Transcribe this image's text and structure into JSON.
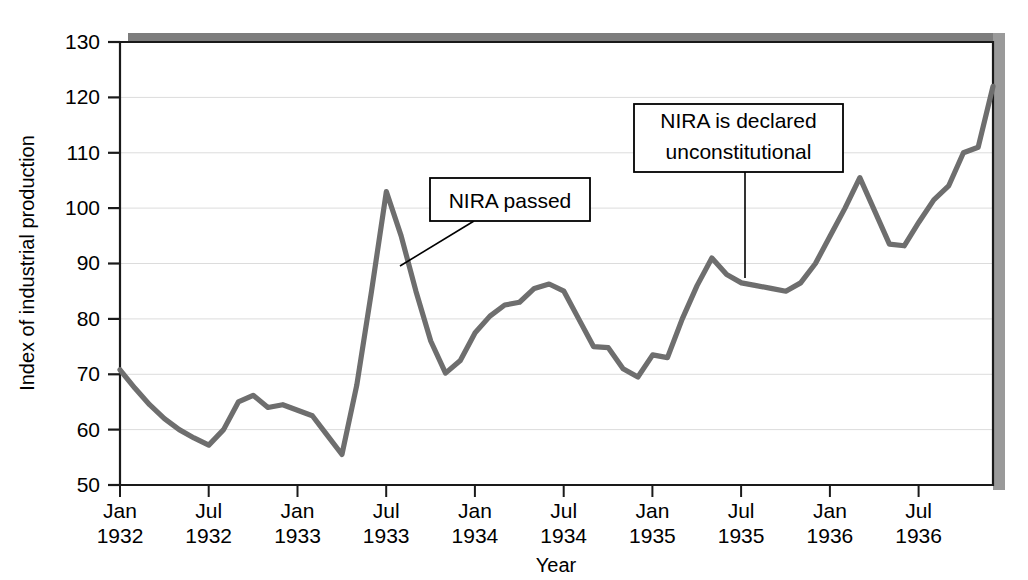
{
  "chart_data": {
    "type": "line",
    "title": "",
    "xlabel": "Year",
    "ylabel": "Index of industrial production",
    "ylim": [
      50,
      130
    ],
    "yticks": [
      50,
      60,
      70,
      80,
      90,
      100,
      110,
      120,
      130
    ],
    "grid": true,
    "legend_position": "none",
    "x_tick_labels": [
      {
        "line1": "Jan",
        "line2": "1932"
      },
      {
        "line1": "Jul",
        "line2": "1932"
      },
      {
        "line1": "Jan",
        "line2": "1933"
      },
      {
        "line1": "Jul",
        "line2": "1933"
      },
      {
        "line1": "Jan",
        "line2": "1934"
      },
      {
        "line1": "Jul",
        "line2": "1934"
      },
      {
        "line1": "Jan",
        "line2": "1935"
      },
      {
        "line1": "Jul",
        "line2": "1935"
      },
      {
        "line1": "Jan",
        "line2": "1936"
      },
      {
        "line1": "Jul",
        "line2": "1936"
      }
    ],
    "x_tick_positions_months": [
      0,
      6,
      12,
      18,
      24,
      30,
      36,
      42,
      48,
      54
    ],
    "x_range_months": [
      0,
      59
    ],
    "series": [
      {
        "name": "Index of industrial production",
        "color": "#6e6e6e",
        "x_months": [
          0,
          1,
          2,
          3,
          4,
          5,
          6,
          7,
          8,
          9,
          10,
          11,
          12,
          13,
          14,
          15,
          16,
          17,
          18,
          19,
          20,
          21,
          22,
          23,
          24,
          25,
          26,
          27,
          28,
          29,
          30,
          31,
          32,
          33,
          34,
          35,
          36,
          37,
          38,
          39,
          40,
          41,
          42,
          43,
          44,
          45,
          46,
          47,
          48,
          49,
          50,
          51,
          52,
          53,
          54,
          55,
          56,
          57,
          58,
          59
        ],
        "values": [
          70.8,
          67.5,
          64.5,
          62.0,
          60.0,
          58.5,
          57.2,
          60.0,
          65.0,
          66.2,
          64.0,
          64.5,
          63.5,
          62.5,
          59.0,
          55.5,
          68.0,
          85.0,
          103.0,
          95.0,
          85.0,
          76.0,
          70.2,
          72.5,
          77.5,
          80.5,
          82.5,
          83.0,
          85.5,
          86.3,
          85.0,
          80.0,
          75.0,
          74.8,
          71.0,
          69.5,
          73.5,
          73.0,
          80.0,
          86.0,
          91.0,
          88.0,
          86.5,
          86.0,
          85.5,
          85.0,
          86.5,
          90.0,
          95.0,
          100.0,
          105.5,
          99.5,
          93.5,
          93.2,
          97.5,
          101.5,
          104.0,
          110.0,
          111.0,
          122.0
        ]
      }
    ],
    "annotations": [
      {
        "id": "nira-passed",
        "text": "NIRA passed",
        "box": {
          "x": 430,
          "y": 178,
          "width": 160,
          "height": 43
        },
        "leader": {
          "x1": 474,
          "y1": 221,
          "x2": 400,
          "y2": 266
        }
      },
      {
        "id": "nira-unconstitutional",
        "line1": "NIRA is declared",
        "line2": "unconstitutional",
        "box": {
          "x": 634,
          "y": 104,
          "width": 209,
          "height": 68
        },
        "leader": {
          "x1": 745,
          "y1": 172,
          "x2": 745,
          "y2": 278
        }
      }
    ]
  },
  "colors": {
    "line": "#6e6e6e",
    "grid": "#d8d8d8",
    "axis": "#1a1a1a",
    "shadow": "#8a8a8a",
    "background": "#ffffff",
    "annotation_border": "#000000"
  }
}
